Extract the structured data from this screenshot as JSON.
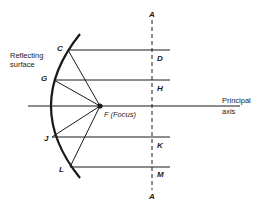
{
  "diagram": {
    "type": "concave mirror reflection diagram",
    "labels": {
      "reflecting_surface_line1": "Reflecting",
      "reflecting_surface_line2": "surface",
      "principal_axis_line1": "Principal",
      "principal_axis_line2": "axis",
      "focus": "F (Focus)",
      "A_top": "A",
      "A_bottom": "A",
      "C": "C",
      "G": "G",
      "J": "J",
      "L": "L",
      "D": "D",
      "H": "H",
      "K": "K",
      "M": "M"
    },
    "colors": {
      "ink": "#1a1a1a",
      "background": "#ffffff"
    }
  }
}
